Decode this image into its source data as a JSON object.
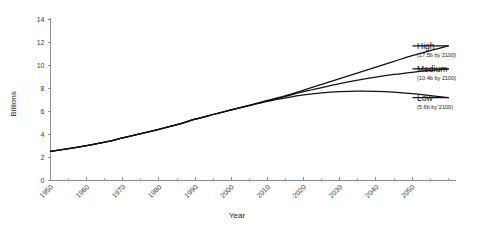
{
  "chart_data": {
    "type": "line",
    "title": "",
    "xlabel": "Year",
    "ylabel": "Billions",
    "xlim": [
      1950,
      2062
    ],
    "ylim": [
      0,
      14
    ],
    "grid": false,
    "legend_position": "right-inline-annotations",
    "x_ticks": [
      1950,
      1960,
      1970,
      1980,
      1990,
      2000,
      2010,
      2020,
      2030,
      2040,
      2050
    ],
    "x_tick_labels": [
      "1950",
      "1960",
      "1970",
      "1980",
      "1990",
      "2000",
      "2010",
      "2020",
      "2030",
      "2040",
      "2050"
    ],
    "x_minor_step": 5,
    "y_ticks": [
      0,
      2,
      4,
      6,
      8,
      10,
      12,
      14
    ],
    "y_tick_labels": [
      "0",
      "2",
      "4",
      "6",
      "8",
      "10",
      "12",
      "14"
    ],
    "x": [
      1950,
      1955,
      1960,
      1965,
      1970,
      1975,
      1980,
      1985,
      1990,
      1995,
      2000,
      2005,
      2010,
      2015,
      2020,
      2025,
      2030,
      2035,
      2040,
      2045,
      2050,
      2055,
      2060
    ],
    "series": [
      {
        "name": "High",
        "color": "#111111",
        "values": [
          2.54,
          2.77,
          3.03,
          3.33,
          3.7,
          4.07,
          4.45,
          4.85,
          5.33,
          5.74,
          6.14,
          6.54,
          6.96,
          7.38,
          7.86,
          8.36,
          8.86,
          9.36,
          9.86,
          10.36,
          10.86,
          11.3,
          11.7
        ]
      },
      {
        "name": "Medium",
        "color": "#111111",
        "values": [
          2.54,
          2.77,
          3.03,
          3.33,
          3.7,
          4.07,
          4.45,
          4.85,
          5.33,
          5.74,
          6.14,
          6.54,
          6.93,
          7.32,
          7.72,
          8.08,
          8.42,
          8.72,
          8.99,
          9.22,
          9.41,
          9.57,
          9.7
        ]
      },
      {
        "name": "Low",
        "color": "#111111",
        "values": [
          2.54,
          2.77,
          3.03,
          3.33,
          3.7,
          4.07,
          4.45,
          4.85,
          5.33,
          5.74,
          6.14,
          6.52,
          6.88,
          7.18,
          7.44,
          7.62,
          7.73,
          7.78,
          7.76,
          7.68,
          7.55,
          7.38,
          7.2
        ]
      }
    ],
    "annotations": [
      {
        "name": "High",
        "sublabel": "(17.5b by 2100)",
        "at_year": 2060,
        "at_value": 11.7
      },
      {
        "name": "Medium",
        "sublabel": "(10.4b by 2100)",
        "at_year": 2060,
        "at_value": 9.7
      },
      {
        "name": "Low",
        "sublabel": "(5.6b by 2100)",
        "at_year": 2060,
        "at_value": 7.2
      }
    ]
  },
  "colors": {
    "line": "#111111",
    "axis": "#8a8a8a",
    "text": "#1a1a1a",
    "background": "#ffffff"
  }
}
